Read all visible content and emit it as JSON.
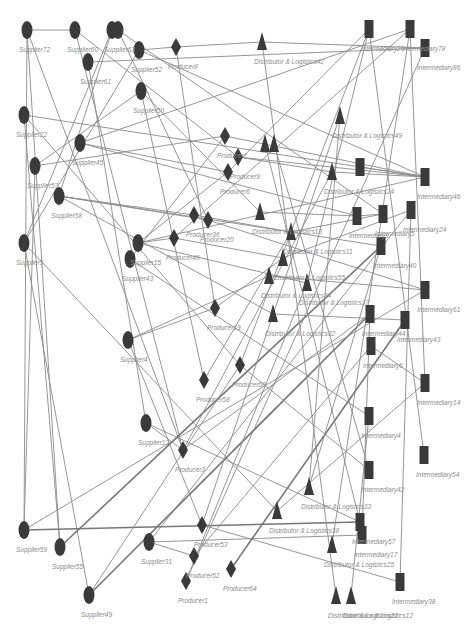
{
  "diagram": {
    "type": "supply-chain-network",
    "node_color": "#3a3a3a",
    "edge_color": "#8a8a8a",
    "node_types": {
      "supplier": "ellipse",
      "producer": "diamond",
      "distributor": "triangle",
      "intermediary": "rectangle"
    },
    "nodes": [
      {
        "id": "s72",
        "type": "supplier",
        "x": 27,
        "y": 30,
        "label": "Supplier72"
      },
      {
        "id": "s60",
        "type": "supplier",
        "x": 75,
        "y": 30,
        "label": "Supplier60"
      },
      {
        "id": "s63a",
        "type": "supplier",
        "x": 112,
        "y": 30,
        "label": "Supplier63"
      },
      {
        "id": "s63b",
        "type": "supplier",
        "x": 118,
        "y": 30,
        "label": ""
      },
      {
        "id": "s52",
        "type": "supplier",
        "x": 139,
        "y": 50,
        "label": "Supplier52"
      },
      {
        "id": "s61",
        "type": "supplier",
        "x": 88,
        "y": 62,
        "label": "Supplier61"
      },
      {
        "id": "s50",
        "type": "supplier",
        "x": 141,
        "y": 91,
        "label": "Supplier50"
      },
      {
        "id": "s22",
        "type": "supplier",
        "x": 24,
        "y": 115,
        "label": "Supplier22"
      },
      {
        "id": "s45",
        "type": "supplier",
        "x": 80,
        "y": 143,
        "label": "Supplier45"
      },
      {
        "id": "s57",
        "type": "supplier",
        "x": 35,
        "y": 166,
        "label": "Supplier57"
      },
      {
        "id": "s58",
        "type": "supplier",
        "x": 59,
        "y": 196,
        "label": "Supplier58"
      },
      {
        "id": "s5",
        "type": "supplier",
        "x": 24,
        "y": 243,
        "label": "Supplier5"
      },
      {
        "id": "s15",
        "type": "supplier",
        "x": 138,
        "y": 243,
        "label": "Supplier15"
      },
      {
        "id": "s43",
        "type": "supplier",
        "x": 130,
        "y": 259,
        "label": "Supplier43"
      },
      {
        "id": "s4",
        "type": "supplier",
        "x": 128,
        "y": 340,
        "label": "Supplier4"
      },
      {
        "id": "s12",
        "type": "supplier",
        "x": 146,
        "y": 423,
        "label": "Supplier12"
      },
      {
        "id": "s59",
        "type": "supplier",
        "x": 24,
        "y": 530,
        "label": "Supplier59"
      },
      {
        "id": "s55",
        "type": "supplier",
        "x": 60,
        "y": 547,
        "label": "Supplier55"
      },
      {
        "id": "s31",
        "type": "supplier",
        "x": 149,
        "y": 542,
        "label": "Supplier31"
      },
      {
        "id": "s49",
        "type": "supplier",
        "x": 89,
        "y": 595,
        "label": "Supplier49"
      },
      {
        "id": "p8",
        "type": "producer",
        "x": 176,
        "y": 47,
        "label": "Producer8"
      },
      {
        "id": "p7",
        "type": "producer",
        "x": 225,
        "y": 136,
        "label": "Producer7"
      },
      {
        "id": "p9",
        "type": "producer",
        "x": 238,
        "y": 157,
        "label": "Producer9"
      },
      {
        "id": "p6",
        "type": "producer",
        "x": 228,
        "y": 172,
        "label": "Producer6"
      },
      {
        "id": "p36",
        "type": "producer",
        "x": 194,
        "y": 215,
        "label": "Producer36"
      },
      {
        "id": "p20",
        "type": "producer",
        "x": 208,
        "y": 220,
        "label": "Producer20"
      },
      {
        "id": "p46",
        "type": "producer",
        "x": 174,
        "y": 238,
        "label": "Producer46"
      },
      {
        "id": "p19",
        "type": "producer",
        "x": 215,
        "y": 308,
        "label": "Producer19"
      },
      {
        "id": "p68",
        "type": "producer",
        "x": 240,
        "y": 365,
        "label": "Producer68"
      },
      {
        "id": "p58",
        "type": "producer",
        "x": 204,
        "y": 380,
        "label": "Producer58"
      },
      {
        "id": "p3",
        "type": "producer",
        "x": 183,
        "y": 450,
        "label": "Producer3"
      },
      {
        "id": "p53",
        "type": "producer",
        "x": 202,
        "y": 525,
        "label": "Producer53"
      },
      {
        "id": "p52",
        "type": "producer",
        "x": 194,
        "y": 556,
        "label": "Producer52"
      },
      {
        "id": "p64",
        "type": "producer",
        "x": 231,
        "y": 569,
        "label": "Producer64"
      },
      {
        "id": "p1",
        "type": "producer",
        "x": 186,
        "y": 581,
        "label": "Producer1"
      },
      {
        "id": "d42",
        "type": "distributor",
        "x": 262,
        "y": 42,
        "label": "Distributor & Logistics42"
      },
      {
        "id": "d49",
        "type": "distributor",
        "x": 340,
        "y": 116,
        "label": "Distributor & Logistics49"
      },
      {
        "id": "d20a",
        "type": "distributor",
        "x": 265,
        "y": 144,
        "label": ""
      },
      {
        "id": "d20b",
        "type": "distributor",
        "x": 274,
        "y": 144,
        "label": ""
      },
      {
        "id": "d24",
        "type": "distributor",
        "x": 332,
        "y": 172,
        "label": "Distributor & Logistics24"
      },
      {
        "id": "d13",
        "type": "distributor",
        "x": 260,
        "y": 212,
        "label": "Distributor & Logistics13"
      },
      {
        "id": "d11",
        "type": "distributor",
        "x": 291,
        "y": 232,
        "label": "Distributor & Logistics11"
      },
      {
        "id": "d55",
        "type": "distributor",
        "x": 283,
        "y": 258,
        "label": "Distributor & Logistics55"
      },
      {
        "id": "d34",
        "type": "distributor",
        "x": 269,
        "y": 276,
        "label": "Distributor & Logistics34"
      },
      {
        "id": "d37",
        "type": "distributor",
        "x": 307,
        "y": 283,
        "label": "Distributor & Logistics37"
      },
      {
        "id": "d32",
        "type": "distributor",
        "x": 273,
        "y": 314,
        "label": "Distributor & Logistics32"
      },
      {
        "id": "d33",
        "type": "distributor",
        "x": 309,
        "y": 487,
        "label": "Distributor & Logistics33"
      },
      {
        "id": "d38",
        "type": "distributor",
        "x": 277,
        "y": 511,
        "label": "Distributor & Logistics38"
      },
      {
        "id": "d25",
        "type": "distributor",
        "x": 332,
        "y": 545,
        "label": "Distributor & Logistics25"
      },
      {
        "id": "d21a",
        "type": "distributor",
        "x": 336,
        "y": 596,
        "label": "Distributor & Logistics21"
      },
      {
        "id": "d21b",
        "type": "distributor",
        "x": 351,
        "y": 596,
        "label": "Distributor & Logistics12"
      },
      {
        "id": "i20",
        "type": "intermediary",
        "x": 369,
        "y": 29,
        "label": "Intermediary20"
      },
      {
        "id": "i78",
        "type": "intermediary",
        "x": 410,
        "y": 29,
        "label": "Intermediary78"
      },
      {
        "id": "i86",
        "type": "intermediary",
        "x": 425,
        "y": 48,
        "label": "Intermediary86"
      },
      {
        "id": "i46a",
        "type": "intermediary",
        "x": 360,
        "y": 167,
        "label": ""
      },
      {
        "id": "i46",
        "type": "intermediary",
        "x": 425,
        "y": 177,
        "label": "Intermediary46"
      },
      {
        "id": "i24",
        "type": "intermediary",
        "x": 411,
        "y": 210,
        "label": "Intermediary24"
      },
      {
        "id": "i9",
        "type": "intermediary",
        "x": 357,
        "y": 216,
        "label": "Intermediary9"
      },
      {
        "id": "i5",
        "type": "intermediary",
        "x": 383,
        "y": 214,
        "label": "Intermediary5"
      },
      {
        "id": "i40",
        "type": "intermediary",
        "x": 381,
        "y": 246,
        "label": "Intermediary40"
      },
      {
        "id": "i61",
        "type": "intermediary",
        "x": 425,
        "y": 290,
        "label": "Intermediary61"
      },
      {
        "id": "i44",
        "type": "intermediary",
        "x": 370,
        "y": 314,
        "label": "Intermediary44"
      },
      {
        "id": "i43",
        "type": "intermediary",
        "x": 405,
        "y": 320,
        "label": "Intermediary43"
      },
      {
        "id": "i6",
        "type": "intermediary",
        "x": 371,
        "y": 346,
        "label": "Intermediary6"
      },
      {
        "id": "i14",
        "type": "intermediary",
        "x": 425,
        "y": 383,
        "label": "Intermediary14"
      },
      {
        "id": "i4",
        "type": "intermediary",
        "x": 369,
        "y": 416,
        "label": "Intermediary4"
      },
      {
        "id": "i54",
        "type": "intermediary",
        "x": 424,
        "y": 455,
        "label": "Intermediary54"
      },
      {
        "id": "i42",
        "type": "intermediary",
        "x": 369,
        "y": 470,
        "label": "Intermediary42"
      },
      {
        "id": "i57",
        "type": "intermediary",
        "x": 360,
        "y": 522,
        "label": "Intermediary57"
      },
      {
        "id": "i17",
        "type": "intermediary",
        "x": 362,
        "y": 535,
        "label": "Intermediary17"
      },
      {
        "id": "i38",
        "type": "intermediary",
        "x": 400,
        "y": 582,
        "label": "Intermediary38"
      }
    ],
    "edges": [
      [
        "s72",
        "s60"
      ],
      [
        "s72",
        "s59"
      ],
      [
        "s72",
        "s55"
      ],
      [
        "s72",
        "p3"
      ],
      [
        "s60",
        "p9"
      ],
      [
        "s60",
        "p3"
      ],
      [
        "s63a",
        "s5"
      ],
      [
        "s63a",
        "s58"
      ],
      [
        "s63b",
        "p20"
      ],
      [
        "s63b",
        "i5"
      ],
      [
        "s52",
        "p8"
      ],
      [
        "s52",
        "i46"
      ],
      [
        "s52",
        "s5"
      ],
      [
        "s61",
        "i86"
      ],
      [
        "s61",
        "s12"
      ],
      [
        "s50",
        "s57"
      ],
      [
        "s50",
        "d13"
      ],
      [
        "s50",
        "p58"
      ],
      [
        "p8",
        "d42"
      ],
      [
        "p8",
        "p19"
      ],
      [
        "s22",
        "i46"
      ],
      [
        "s22",
        "s55"
      ],
      [
        "s22",
        "p68"
      ],
      [
        "s45",
        "i78"
      ],
      [
        "s45",
        "i9"
      ],
      [
        "s45",
        "p6"
      ],
      [
        "s57",
        "p7"
      ],
      [
        "s57",
        "s59"
      ],
      [
        "s58",
        "p36"
      ],
      [
        "s58",
        "p20"
      ],
      [
        "s58",
        "i40"
      ],
      [
        "s58",
        "d32"
      ],
      [
        "s5",
        "d38"
      ],
      [
        "s5",
        "s49"
      ],
      [
        "s15",
        "p6"
      ],
      [
        "s15",
        "p46"
      ],
      [
        "s15",
        "i46"
      ],
      [
        "s15",
        "d37"
      ],
      [
        "s43",
        "p7"
      ],
      [
        "s43",
        "i4"
      ],
      [
        "s4",
        "p19"
      ],
      [
        "s4",
        "d34"
      ],
      [
        "s4",
        "p53"
      ],
      [
        "s12",
        "p3"
      ],
      [
        "s12",
        "i57"
      ],
      [
        "s59",
        "i57"
      ],
      [
        "s55",
        "i40"
      ],
      [
        "s31",
        "p52"
      ],
      [
        "s31",
        "i17"
      ],
      [
        "s31",
        "i24"
      ],
      [
        "s49",
        "p68"
      ],
      [
        "s49",
        "i44"
      ],
      [
        "p7",
        "i46"
      ],
      [
        "p9",
        "i46"
      ],
      [
        "p9",
        "d24"
      ],
      [
        "p6",
        "i20"
      ],
      [
        "p36",
        "d11"
      ],
      [
        "p20",
        "i61"
      ],
      [
        "p46",
        "i78"
      ],
      [
        "p46",
        "d55"
      ],
      [
        "p19",
        "d55"
      ],
      [
        "p68",
        "i20"
      ],
      [
        "p68",
        "i42"
      ],
      [
        "p58",
        "d11"
      ],
      [
        "p3",
        "i44"
      ],
      [
        "p3",
        "d24"
      ],
      [
        "p53",
        "i38"
      ],
      [
        "p53",
        "d49"
      ],
      [
        "p52",
        "i6"
      ],
      [
        "p64",
        "i43"
      ],
      [
        "p1",
        "d37"
      ],
      [
        "p1",
        "i86"
      ],
      [
        "d42",
        "i86"
      ],
      [
        "d42",
        "d21a"
      ],
      [
        "d49",
        "d33"
      ],
      [
        "d20a",
        "i57"
      ],
      [
        "d20b",
        "i42"
      ],
      [
        "d24",
        "i46"
      ],
      [
        "d13",
        "i9"
      ],
      [
        "d11",
        "i5"
      ],
      [
        "d55",
        "i24"
      ],
      [
        "d34",
        "i61"
      ],
      [
        "d37",
        "i20"
      ],
      [
        "d32",
        "i43"
      ],
      [
        "d33",
        "i40"
      ],
      [
        "d38",
        "i14"
      ],
      [
        "d25",
        "i78"
      ],
      [
        "d21b",
        "i4"
      ],
      [
        "i20",
        "i54"
      ],
      [
        "i78",
        "i14"
      ],
      [
        "i9",
        "i5"
      ],
      [
        "i6",
        "i14"
      ],
      [
        "i24",
        "i38"
      ],
      [
        "i61",
        "s59"
      ],
      [
        "i46a",
        "i46"
      ],
      [
        "i44",
        "i17"
      ]
    ],
    "thick_edges": [
      [
        "s55",
        "i40"
      ],
      [
        "s59",
        "i57"
      ],
      [
        "s49",
        "i44"
      ],
      [
        "p64",
        "i43"
      ]
    ]
  }
}
